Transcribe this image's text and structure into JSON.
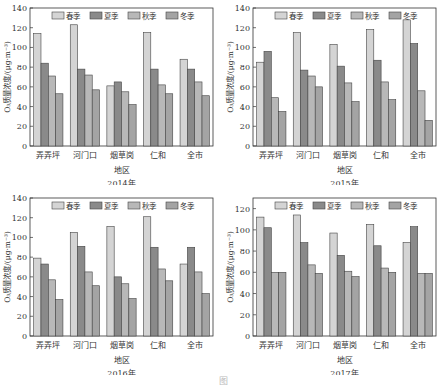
{
  "figure": {
    "caption": "图"
  },
  "chart_data": [
    {
      "type": "bar",
      "title": "2014年",
      "xlabel": "地区",
      "ylabel": "O₃质量浓度/(μg·m⁻³)",
      "ylim": [
        0,
        140
      ],
      "yticks": [
        0,
        20,
        40,
        60,
        80,
        100,
        120,
        140
      ],
      "categories": [
        "弄弄坪",
        "河门口",
        "烟草岗",
        "仁和",
        "全市"
      ],
      "legend_position": "top",
      "series": [
        {
          "name": "春季",
          "values": [
            114,
            123,
            61,
            115,
            88
          ]
        },
        {
          "name": "夏季",
          "values": [
            84,
            78,
            65,
            78,
            78
          ]
        },
        {
          "name": "秋季",
          "values": [
            71,
            72,
            55,
            62,
            65
          ]
        },
        {
          "name": "冬季",
          "values": [
            53,
            57,
            42,
            53,
            51
          ]
        }
      ]
    },
    {
      "type": "bar",
      "title": "2015年",
      "xlabel": "地区",
      "ylabel": "O₃质量浓度/(μg·m⁻³)",
      "ylim": [
        0,
        140
      ],
      "yticks": [
        0,
        20,
        40,
        60,
        80,
        100,
        120,
        140
      ],
      "categories": [
        "弄弄坪",
        "河门口",
        "烟草岗",
        "仁和",
        "全市"
      ],
      "legend_position": "top",
      "series": [
        {
          "name": "春季",
          "values": [
            85,
            115,
            103,
            118,
            128
          ]
        },
        {
          "name": "夏季",
          "values": [
            96,
            77,
            81,
            87,
            104
          ]
        },
        {
          "name": "秋季",
          "values": [
            49,
            71,
            64,
            65,
            56
          ]
        },
        {
          "name": "冬季",
          "values": [
            35,
            60,
            45,
            47,
            26
          ]
        }
      ]
    },
    {
      "type": "bar",
      "title": "2016年",
      "xlabel": "地区",
      "ylabel": "O₃质量浓度/(μg·m⁻³)",
      "ylim": [
        0,
        140
      ],
      "yticks": [
        0,
        20,
        40,
        60,
        80,
        100,
        120,
        140
      ],
      "categories": [
        "弄弄坪",
        "河门口",
        "烟草岗",
        "仁和",
        "全市"
      ],
      "legend_position": "top",
      "series": [
        {
          "name": "春季",
          "values": [
            79,
            105,
            111,
            121,
            73
          ]
        },
        {
          "name": "夏季",
          "values": [
            73,
            91,
            60,
            90,
            90
          ]
        },
        {
          "name": "秋季",
          "values": [
            57,
            65,
            53,
            68,
            65
          ]
        },
        {
          "name": "冬季",
          "values": [
            37,
            51,
            38,
            56,
            43
          ]
        }
      ]
    },
    {
      "type": "bar",
      "title": "2017年",
      "xlabel": "地区",
      "ylabel": "O₃质量浓度/(μg·m⁻³)",
      "ylim": [
        0,
        130
      ],
      "yticks": [
        0,
        20,
        40,
        60,
        80,
        100,
        120
      ],
      "categories": [
        "弄弄坪",
        "河门口",
        "烟草岗",
        "仁和",
        "全市"
      ],
      "legend_position": "top",
      "series": [
        {
          "name": "春季",
          "values": [
            112,
            114,
            97,
            105,
            88
          ]
        },
        {
          "name": "夏季",
          "values": [
            102,
            88,
            76,
            85,
            103
          ]
        },
        {
          "name": "秋季",
          "values": [
            60,
            67,
            61,
            64,
            59
          ]
        },
        {
          "name": "冬季",
          "values": [
            60,
            59,
            56,
            60,
            59
          ]
        }
      ]
    }
  ],
  "colors": {
    "series": [
      "#d4d4d4",
      "#8a8a8a",
      "#b8b8b8",
      "#a4a4a4"
    ],
    "axis": "#333333"
  }
}
